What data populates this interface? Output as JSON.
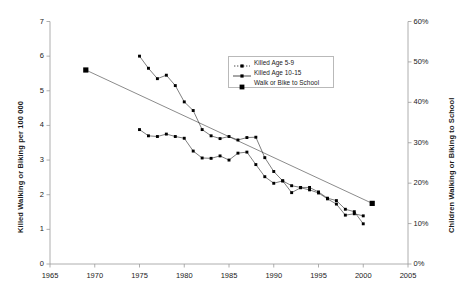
{
  "chart_data": {
    "type": "line",
    "title": "",
    "xlabel": "",
    "ylabel": "Killed Walking or Biking per 100 000",
    "ylabel_right": "Children Walking or Biking to School",
    "xlim": [
      1965,
      2005
    ],
    "ylim": [
      0,
      7
    ],
    "ylim_right": [
      0,
      60
    ],
    "grid": false,
    "legend_position": "upper-center-right",
    "xticks": [
      "1965",
      "1970",
      "1975",
      "1980",
      "1985",
      "1990",
      "1995",
      "2000",
      "2005"
    ],
    "xtick_values": [
      1965,
      1970,
      1975,
      1980,
      1985,
      1990,
      1995,
      2000,
      2005
    ],
    "yticks_left": [
      "0",
      "1",
      "2",
      "3",
      "4",
      "5",
      "6",
      "7"
    ],
    "ytick_values_left": [
      0,
      1,
      2,
      3,
      4,
      5,
      6,
      7
    ],
    "yticks_right": [
      "0%",
      "10%",
      "20%",
      "30%",
      "40%",
      "50%",
      "60%"
    ],
    "ytick_values_right": [
      0,
      10,
      20,
      30,
      40,
      50,
      60
    ],
    "series": [
      {
        "name": "Killed Age 5-9",
        "axis": "left",
        "marker": "small-square",
        "color": "#000000",
        "x": [
          1975,
          1976,
          1977,
          1978,
          1979,
          1980,
          1981,
          1982,
          1983,
          1984,
          1985,
          1986,
          1987,
          1988,
          1989,
          1990,
          1991,
          1992,
          1993,
          1994,
          1995,
          1996,
          1997,
          1998,
          1999,
          2000
        ],
        "values": [
          6.0,
          5.65,
          5.35,
          5.45,
          5.15,
          4.68,
          4.43,
          3.88,
          3.7,
          3.62,
          3.68,
          3.58,
          3.65,
          3.66,
          3.07,
          2.67,
          2.4,
          2.26,
          2.21,
          2.21,
          2.08,
          1.9,
          1.83,
          1.58,
          1.51,
          1.16
        ]
      },
      {
        "name": "Killed Age 10-15",
        "axis": "left",
        "marker": "small-square",
        "color": "#000000",
        "x": [
          1975,
          1976,
          1977,
          1978,
          1979,
          1980,
          1981,
          1982,
          1983,
          1984,
          1985,
          1986,
          1987,
          1988,
          1989,
          1990,
          1991,
          1992,
          1993,
          1994,
          1995,
          1996,
          1997,
          1998,
          1999,
          2000
        ],
        "values": [
          3.88,
          3.7,
          3.68,
          3.75,
          3.68,
          3.63,
          3.26,
          3.06,
          3.05,
          3.12,
          3.0,
          3.2,
          3.23,
          2.87,
          2.52,
          2.33,
          2.4,
          2.06,
          2.2,
          2.14,
          2.05,
          1.88,
          1.73,
          1.41,
          1.45,
          1.39
        ]
      },
      {
        "name": "Walk or Bike to School",
        "axis": "right",
        "marker": "big-square",
        "color": "#000000",
        "x": [
          1969,
          2001
        ],
        "values": [
          48.0,
          15.0
        ],
        "values_left_scale": [
          5.6,
          1.75
        ]
      }
    ]
  },
  "legend": {
    "items": [
      {
        "label": "Killed Age 5-9",
        "marker": "dotted-square-marker"
      },
      {
        "label": "Killed Age 10-15",
        "marker": "line-square-marker"
      },
      {
        "label": "Walk or Bike to School",
        "marker": "filled-square-marker"
      }
    ]
  },
  "axes": {
    "left_title": "Killed Walking or Biking per 100 000",
    "right_title": "Children Walking or Biking to School"
  }
}
